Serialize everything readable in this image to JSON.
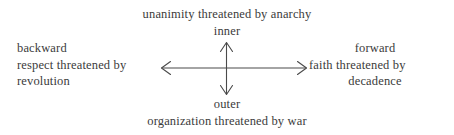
{
  "diagram": {
    "type": "two-axis-cross",
    "background_color": "#ffffff",
    "ink_color": "#3b3b3b",
    "top_caption": "unanimity threatened by anarchy",
    "bottom_caption": "organization threatened by war",
    "axes": {
      "vertical": {
        "up_label": "inner",
        "down_label": "outer",
        "arrowheads": "both"
      },
      "horizontal": {
        "left_label": "backward",
        "right_label": "forward",
        "arrowheads": "both"
      }
    },
    "left_block": {
      "heading": "backward",
      "line2": "respect threatened by",
      "line3": "revolution"
    },
    "right_block": {
      "heading": "forward",
      "line2": "faith threatened by",
      "line3": "decadence"
    },
    "icons": {
      "arrow_up": "arrow-up-icon",
      "arrow_down": "arrow-down-icon",
      "arrow_left": "arrow-left-icon",
      "arrow_right": "arrow-right-icon"
    }
  }
}
